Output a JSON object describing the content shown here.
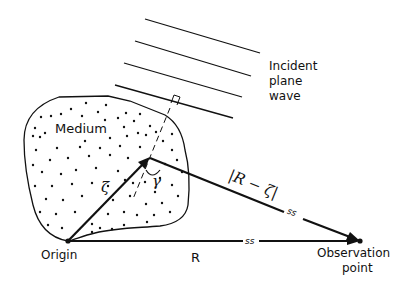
{
  "diagram": {
    "labels": {
      "incident_line1": "Incident",
      "incident_line2": "plane",
      "incident_line3": "wave",
      "medium": "Medium",
      "origin": "Origin",
      "observation_line1": "Observation",
      "observation_line2": "point",
      "R": "R",
      "zeta": "ζ",
      "gamma": "γ",
      "R_minus_zeta": "|R − ζ|",
      "break_mark": "ss"
    },
    "colors": {
      "line": "#111111",
      "background": "#ffffff"
    },
    "points": {
      "origin": [
        68,
        241
      ],
      "scatterer": [
        148,
        159
      ],
      "observation": [
        360,
        241
      ]
    }
  }
}
